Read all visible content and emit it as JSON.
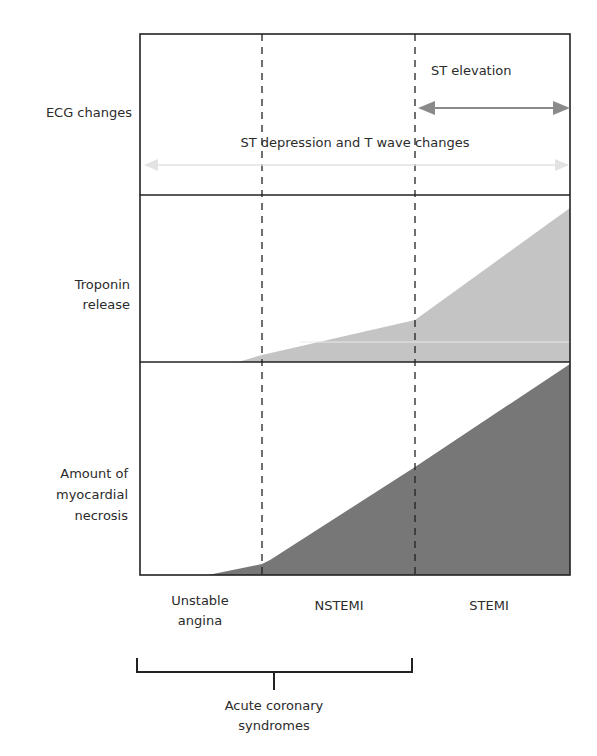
{
  "rows": {
    "ecg": "ECG changes",
    "troponin_line1": "Troponin",
    "troponin_line2": "release",
    "necrosis_line1": "Amount of",
    "necrosis_line2": "myocardial",
    "necrosis_line3": "necrosis"
  },
  "ecg_annotations": {
    "st_elevation": "ST elevation",
    "st_depression": "ST depression and T wave changes"
  },
  "columns": {
    "unstable_line1": "Unstable",
    "unstable_line2": "angina",
    "nstemi": "NSTEMI",
    "stemi": "STEMI"
  },
  "bracket": {
    "label_line1": "Acute coronary",
    "label_line2": "syndromes"
  },
  "colors": {
    "frame": "#222222",
    "troponin_fill": "#c4c4c4",
    "necrosis_fill": "#777777",
    "st_elevation_arrow": "#8a8a8a",
    "st_depression_arrow": "#e3e3e3"
  }
}
